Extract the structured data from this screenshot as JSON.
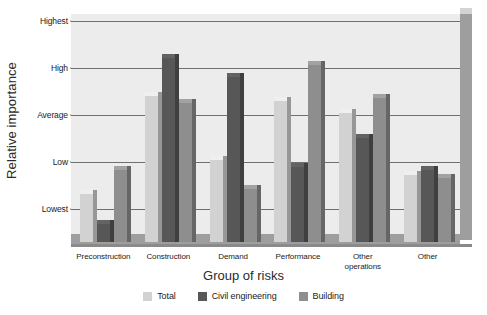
{
  "chart_data": {
    "type": "bar",
    "title": "",
    "xlabel": "Group of risks",
    "ylabel": "Relative importance",
    "categories": [
      "Preconstruction",
      "Construction",
      "Demand",
      "Performance",
      "Other operations",
      "Other"
    ],
    "ytick_labels": [
      "Highest",
      "High",
      "Average",
      "Low",
      "Lowest"
    ],
    "ytick_values": [
      5,
      4,
      3,
      2,
      1
    ],
    "ylim": [
      0.35,
      5.15
    ],
    "grid": true,
    "legend_position": "bottom",
    "series": [
      {
        "name": "Total",
        "color": "#d2d2d2",
        "values": [
          1.38,
          3.45,
          2.09,
          3.35,
          3.08,
          1.77
        ]
      },
      {
        "name": "Civil engineering",
        "color": "#575757",
        "values": [
          0.74,
          4.25,
          3.85,
          1.95,
          2.55,
          1.88
        ]
      },
      {
        "name": "Building",
        "color": "#8e8e8e",
        "values": [
          1.88,
          3.3,
          1.48,
          4.1,
          3.4,
          1.72
        ]
      }
    ]
  },
  "axis": {
    "y_title": "Relative importance",
    "x_title": "Group of risks"
  },
  "legend": {
    "items": [
      {
        "label": "Total",
        "color": "#d2d2d2"
      },
      {
        "label": "Civil engineering",
        "color": "#575757"
      },
      {
        "label": "Building",
        "color": "#8e8e8e"
      }
    ]
  }
}
